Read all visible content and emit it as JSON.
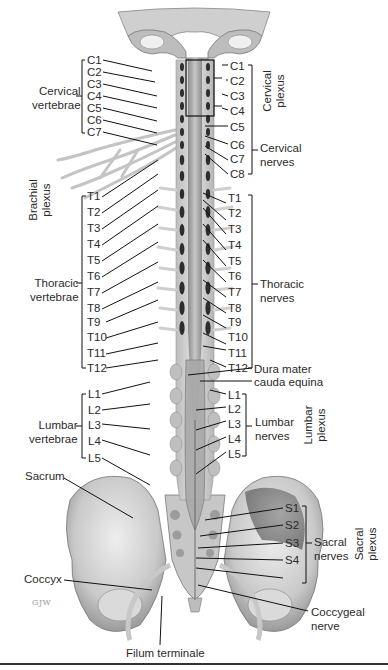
{
  "figure": {
    "type": "anatomical-illustration",
    "signature": "GJW"
  },
  "left_labels": {
    "cervical_vertebrae": {
      "group": "Cervical\nvertebrae",
      "line1": "Cervical",
      "line2": "vertebrae",
      "items": [
        "C1",
        "C2",
        "C3",
        "C4",
        "C5",
        "C6",
        "C7"
      ]
    },
    "brachial_plexus": {
      "line1": "Brachial",
      "line2": "plexus"
    },
    "thoracic_vertebrae": {
      "line1": "Thoracic",
      "line2": "vertebrae",
      "items": [
        "T1",
        "T2",
        "T3",
        "T4",
        "T5",
        "T6",
        "T7",
        "T8",
        "T9",
        "T10",
        "T11",
        "T12"
      ]
    },
    "lumbar_vertebrae": {
      "line1": "Lumbar",
      "line2": "vertebrae",
      "items": [
        "L1",
        "L2",
        "L3",
        "L4",
        "L5"
      ]
    },
    "sacrum": "Sacrum",
    "coccyx": "Coccyx"
  },
  "right_labels": {
    "cervical_nerves": {
      "line1": "Cervical",
      "line2": "nerves",
      "items": [
        "C1",
        "C2",
        "C3",
        "C4",
        "C5",
        "C6",
        "C7",
        "C8"
      ]
    },
    "cervical_plexus": {
      "line1": "Cervical",
      "line2": "plexus"
    },
    "thoracic_nerves": {
      "line1": "Thoracic",
      "line2": "nerves",
      "items": [
        "T1",
        "T2",
        "T3",
        "T4",
        "T5",
        "T6",
        "T7",
        "T8",
        "T9",
        "T10",
        "T11",
        "T12"
      ]
    },
    "dura_mater": "Dura mater",
    "cauda_equina": "cauda equina",
    "lumbar_nerves": {
      "line1": "Lumbar",
      "line2": "nerves",
      "items": [
        "L1",
        "L2",
        "L3",
        "L4",
        "L5"
      ]
    },
    "lumbar_plexus": {
      "line1": "Lumbar",
      "line2": "plexus"
    },
    "sacral_nerves": {
      "line1": "Sacral",
      "line2": "nerves",
      "items": [
        "S1",
        "S2",
        "S3",
        "S4"
      ]
    },
    "sacral_plexus": {
      "line1": "Sacral",
      "line2": "plexus"
    },
    "coccygeal_nerve": {
      "line1": "Coccygeal",
      "line2": "nerve"
    }
  },
  "bottom_labels": {
    "filum_terminale": "Filum terminale"
  }
}
